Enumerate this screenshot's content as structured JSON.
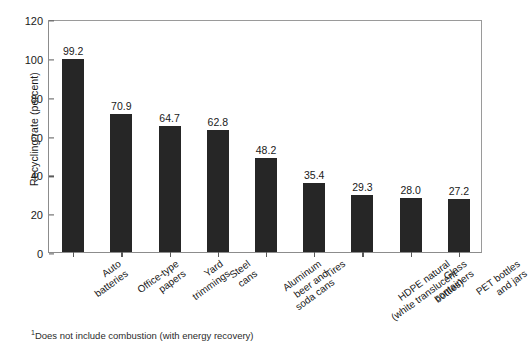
{
  "chart_data": {
    "type": "bar",
    "title": "",
    "subtitle": "",
    "xlabel": "",
    "ylabel": "Recycling rate (percent)",
    "ylim": [
      0,
      120
    ],
    "yticks": [
      "0",
      "20",
      "40",
      "60",
      "80",
      "100",
      "120"
    ],
    "grid": false,
    "legend": "none",
    "bar_color": "#262626",
    "categories": [
      "Auto batteries",
      "Office-type papers",
      "Yard trimmings",
      "Steel cans",
      "Aluminum beer and soda cans",
      "Tires",
      "HDPE natural (white translucent bottles)",
      "Glass containers",
      "PET bottles and jars"
    ],
    "category_lines": [
      [
        "Auto",
        "batteries"
      ],
      [
        "Office-type",
        "papers"
      ],
      [
        "Yard",
        "trimmings"
      ],
      [
        "Steel",
        "cans"
      ],
      [
        "Aluminum",
        "beer and",
        "soda cans"
      ],
      [
        "Tires"
      ],
      [
        "HDPE natural",
        "(white translucent",
        "bottles)"
      ],
      [
        "Glass",
        "containers"
      ],
      [
        "PET bottles",
        "and jars"
      ]
    ],
    "values": [
      99.2,
      70.9,
      64.7,
      62.8,
      48.2,
      35.4,
      29.3,
      28.0,
      27.2
    ],
    "value_labels": [
      "99.2",
      "70.9",
      "64.7",
      "62.8",
      "48.2",
      "35.4",
      "29.3",
      "28.0",
      "27.2"
    ]
  },
  "footnote": {
    "marker": "1",
    "text": "Does not include combustion (with energy recovery)"
  }
}
